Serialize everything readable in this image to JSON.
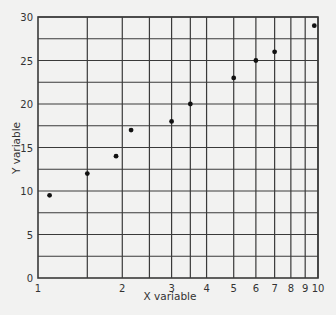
{
  "chart_data": {
    "type": "scatter",
    "title": "",
    "xlabel": "X variable",
    "ylabel": "Y variable",
    "xscale": "log",
    "xlim": [
      1,
      10
    ],
    "ylim": [
      0,
      30
    ],
    "grid": true,
    "x_ticks": [
      1,
      2,
      3,
      4,
      5,
      6,
      7,
      8,
      9,
      10
    ],
    "x_gridlines": [
      1.5,
      2,
      2.5,
      3,
      3.5,
      4,
      5,
      6,
      7,
      8,
      9,
      10
    ],
    "y_ticks": [
      0,
      5,
      10,
      15,
      20,
      25,
      30
    ],
    "y_gridlines": [
      2.5,
      5,
      7.5,
      10,
      12.5,
      15,
      17.5,
      20,
      22.5,
      25,
      27.5,
      30
    ],
    "series": [
      {
        "name": "data",
        "points": [
          {
            "x": 1.1,
            "y": 9.5
          },
          {
            "x": 1.5,
            "y": 12
          },
          {
            "x": 1.9,
            "y": 14
          },
          {
            "x": 2.15,
            "y": 17
          },
          {
            "x": 3,
            "y": 18
          },
          {
            "x": 3.5,
            "y": 20
          },
          {
            "x": 5,
            "y": 23
          },
          {
            "x": 6,
            "y": 25
          },
          {
            "x": 7,
            "y": 26
          },
          {
            "x": 9.7,
            "y": 29
          }
        ]
      }
    ]
  },
  "colors": {
    "grid": "#3a3a3a",
    "point": "#111111",
    "background": "#f2f2f1"
  }
}
